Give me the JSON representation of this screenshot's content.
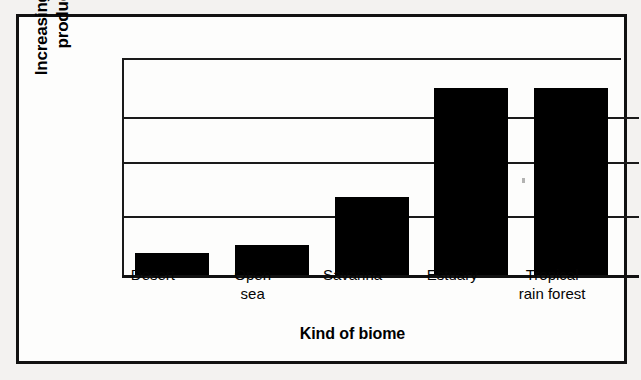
{
  "figure": {
    "frame_color": "#111111",
    "background_color": "#fdfdfc",
    "page_background": "#f3f2f0"
  },
  "chart_data": {
    "type": "bar",
    "title": "",
    "subtitle": "",
    "xlabel": "Kind of biome",
    "ylabel": "Increasing primary\nproductivity",
    "ylabel_line1": "Increasing primary",
    "ylabel_line2": "productivity",
    "categories": [
      "Desert",
      "Open\nsea",
      "Savanna",
      "Estuary",
      "Tropical\nrain forest"
    ],
    "values": [
      0.1,
      0.14,
      0.36,
      0.86,
      0.86
    ],
    "ylim": [
      0,
      1
    ],
    "y_tick_labels": [],
    "gridlines": [
      0.0,
      0.27,
      0.52,
      0.73,
      1.0
    ],
    "grid": true,
    "legend": "none",
    "bar_color": "#000000",
    "bar_width_fraction": 0.74,
    "axis_note": "Y axis is unlabeled and qualitative — it only indicates increasing primary productivity."
  },
  "axis": {
    "y_title": "Increasing primary\nproductivity",
    "x_title": "Kind of biome"
  },
  "labels": {
    "desert": "Desert",
    "open_sea": "Open\nsea",
    "savanna": "Savanna",
    "estuary": "Estuary",
    "tropical_rain_forest": "Tropical\nrain forest"
  }
}
